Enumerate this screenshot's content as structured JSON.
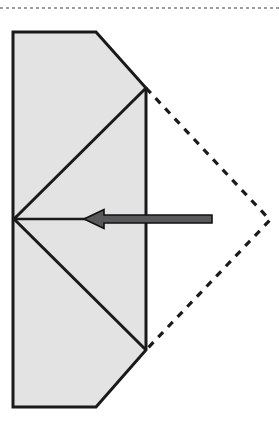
{
  "document": {
    "title": "Origami fold step diagram",
    "background_color": "#ffffff"
  },
  "page_rule": {
    "name": "page-boundary-rule",
    "style": "dotted",
    "color": "#3a3a3a",
    "y": 8,
    "x_start": 0,
    "x_end": 279,
    "thickness": 1.2,
    "dash_pattern": "3,3"
  },
  "diagram": {
    "label": "fold-diagram",
    "stroke_color": "#1a1a1a",
    "fill_color": "#e3e3e3",
    "stroke_width": 3,
    "shaded_shape": {
      "name": "folded-paper-outline",
      "description": "Rectangle with beveled upper-right and lower-right corners",
      "points": "13,32 96,32 146,88 146,350 96,407 13,407",
      "fill": "#e3e3e3",
      "stroke": "#1a1a1a",
      "stroke_width": 3
    },
    "fold_lines": [
      {
        "name": "upper-fold-crease",
        "from": [
          14,
          219
        ],
        "to": [
          146,
          88
        ],
        "stroke": "#1a1a1a",
        "stroke_width": 3,
        "style": "solid"
      },
      {
        "name": "lower-fold-crease",
        "from": [
          14,
          219
        ],
        "to": [
          146,
          350
        ],
        "stroke": "#1a1a1a",
        "stroke_width": 3,
        "style": "solid"
      }
    ],
    "dashed_outline": {
      "name": "hidden-flap-outline",
      "description": "Dashed triangle showing position of unfolded flap",
      "points": "146,88 270,220 146,350",
      "stroke": "#1a1a1a",
      "stroke_width": 3.2,
      "dash_pattern": "7,7",
      "apex": [
        270,
        220
      ]
    },
    "arrow": {
      "name": "fold-direction-arrow",
      "direction": "left",
      "tip": [
        84,
        219
      ],
      "tail": [
        212,
        219
      ],
      "shaft_thickness": 8,
      "head_width": 20,
      "head_height": 19,
      "fill": "#59595b",
      "stroke": "#111111",
      "stroke_width": 1.6
    },
    "guide_line": {
      "name": "arrow-guide-line",
      "from": [
        14,
        219
      ],
      "to": [
        96,
        219
      ],
      "stroke": "#1a1a1a",
      "stroke_width": 2.4
    }
  }
}
